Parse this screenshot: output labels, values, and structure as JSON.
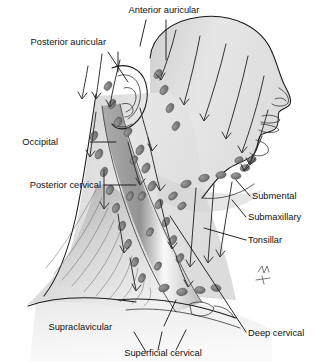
{
  "figure": {
    "view": "right lateral profile",
    "style": "grayscale medical illustration",
    "background_color": "#ffffff",
    "ink_color": "#1a1a1a",
    "skin_fill": "#e4e4e4",
    "skin_shadow": "#c9c9c9",
    "muscle_fill": "#b9b9b9",
    "node_fill": "#7b7b7b",
    "node_stroke": "#4a4a4a",
    "highlight": "#f6f6f6"
  },
  "labels": [
    {
      "id": "anterior-auricular",
      "text": "Anterior auricular",
      "x": 164,
      "y": 13,
      "anchor": "c"
    },
    {
      "id": "posterior-auricular",
      "text": "Posterior auricular",
      "x": 106,
      "y": 45,
      "anchor": "l"
    },
    {
      "id": "occipital",
      "text": "Occipital",
      "x": 58,
      "y": 145,
      "anchor": "l"
    },
    {
      "id": "posterior-cervical",
      "text": "Posterior cervical",
      "x": 101,
      "y": 188,
      "anchor": "l"
    },
    {
      "id": "supraclavicular",
      "text": "Supraclavicular",
      "x": 112,
      "y": 330,
      "anchor": "l"
    },
    {
      "id": "superficial-cervical",
      "text": "Superficial cervical",
      "x": 163,
      "y": 356,
      "anchor": "c"
    },
    {
      "id": "deep-cervical",
      "text": "Deep cervical",
      "x": 248,
      "y": 336,
      "anchor": "l"
    },
    {
      "id": "tonsillar",
      "text": "Tonsillar",
      "x": 248,
      "y": 243,
      "anchor": "l"
    },
    {
      "id": "submaxillary",
      "text": "Submaxillary",
      "x": 248,
      "y": 220,
      "anchor": "l"
    },
    {
      "id": "submental",
      "text": "Submental",
      "x": 252,
      "y": 199,
      "anchor": "l"
    }
  ],
  "node_groups": [
    {
      "id": "anterior-auricular",
      "count": 4,
      "region": "in front of ear"
    },
    {
      "id": "posterior-auricular",
      "count": 3,
      "region": "behind ear / mastoid"
    },
    {
      "id": "occipital",
      "count": 4,
      "region": "back of skull base"
    },
    {
      "id": "posterior-cervical",
      "count": 6,
      "region": "posterior triangle"
    },
    {
      "id": "deep-cervical",
      "count": 7,
      "region": "along sternocleidomastoid"
    },
    {
      "id": "superficial-cervical",
      "count": 5,
      "region": "over sternocleidomastoid"
    },
    {
      "id": "supraclavicular",
      "count": 4,
      "region": "above clavicle"
    },
    {
      "id": "submaxillary",
      "count": 4,
      "region": "under mandible"
    },
    {
      "id": "submental",
      "count": 3,
      "region": "under chin"
    },
    {
      "id": "tonsillar",
      "count": 2,
      "region": "angle of jaw"
    }
  ],
  "drainage_arrows": {
    "count": 22,
    "direction": "toward deep cervical chain and supraclavicular nodes"
  }
}
